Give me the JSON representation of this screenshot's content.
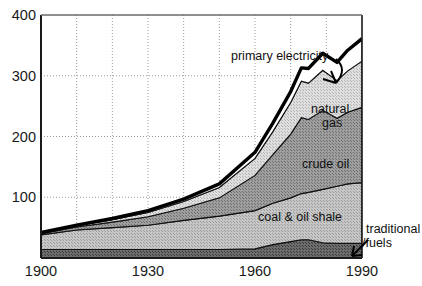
{
  "chart_data": {
    "type": "area",
    "title": "",
    "subtitle": "",
    "xlabel": "",
    "ylabel": "",
    "xlim": [
      1900,
      1990
    ],
    "ylim": [
      0,
      400
    ],
    "grid": true,
    "legend_position": "inline-annotations",
    "yticks": [
      100,
      200,
      300,
      400
    ],
    "ytick_labels": [
      "100",
      "200",
      "300",
      "400"
    ],
    "xticks": [
      1900,
      1930,
      1960,
      1990
    ],
    "xtick_labels": [
      "1900",
      "1930",
      "1960",
      "1990"
    ],
    "x_gridlines": [
      1910,
      1920,
      1930,
      1940,
      1950,
      1960,
      1970,
      1980
    ],
    "x": [
      1900,
      1910,
      1920,
      1930,
      1940,
      1950,
      1960,
      1965,
      1970,
      1973,
      1975,
      1979,
      1983,
      1986,
      1990
    ],
    "stack_order": [
      "traditional_fuels",
      "coal_and_oil_shale",
      "crude_oil",
      "natural_gas",
      "primary_electricity"
    ],
    "series": [
      {
        "name": "traditional fuels",
        "label": "traditional",
        "label_line2": "/fuels",
        "fill": "#4a4a4a",
        "values": [
          14,
          14,
          14,
          14,
          14,
          14,
          15,
          22,
          27,
          30,
          30,
          25,
          24,
          24,
          24
        ]
      },
      {
        "name": "coal & oil shale",
        "label": "coal & oil shale",
        "fill": "#b0b0b0",
        "values": [
          24,
          32,
          36,
          40,
          48,
          55,
          63,
          68,
          72,
          76,
          78,
          88,
          94,
          98,
          100
        ]
      },
      {
        "name": "crude oil",
        "label": "crude oil",
        "fill": "#8c8c8c",
        "values": [
          2,
          5,
          9,
          14,
          20,
          30,
          58,
          80,
          105,
          125,
          120,
          130,
          112,
          118,
          124
        ]
      },
      {
        "name": "natural gas",
        "label": "natural",
        "label_line2": "gas",
        "fill": "#cfcfcf",
        "values": [
          1,
          2,
          4,
          7,
          11,
          17,
          28,
          38,
          52,
          60,
          60,
          66,
          62,
          68,
          76
        ]
      },
      {
        "name": "primary electricity",
        "label": "primary electricity",
        "fill": "#ffffff",
        "values": [
          1,
          1,
          2,
          3,
          4,
          6,
          10,
          14,
          18,
          22,
          24,
          28,
          30,
          34,
          37
        ]
      }
    ],
    "total_label": "total primary energy",
    "totals": [
      42,
      54,
      65,
      78,
      97,
      122,
      174,
      222,
      274,
      313,
      312,
      337,
      322,
      342,
      361
    ],
    "annotations": [
      {
        "name": "primary-electricity",
        "text": "primary electricity",
        "x": 230,
        "y": 60,
        "arrow": true
      },
      {
        "name": "natural-gas",
        "text": "natural",
        "text2": "gas",
        "x": 311,
        "y": 113
      },
      {
        "name": "crude-oil",
        "text": "crude oil",
        "x": 302,
        "y": 168
      },
      {
        "name": "coal-oil-shale",
        "text": "coal & oil shale",
        "x": 294,
        "y": 221
      },
      {
        "name": "traditional-fuels",
        "text": "traditional",
        "text2": "/fuels",
        "x": 363,
        "y": 233,
        "arrow": true
      }
    ]
  },
  "colors": {
    "axis": "#1a1a1a",
    "grid": "#9a9a9a",
    "total_line": "#000000",
    "background": "#ffffff",
    "text": "#111111"
  }
}
